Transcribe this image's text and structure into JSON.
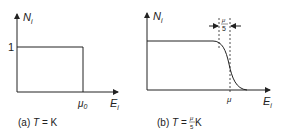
{
  "panel_a": {
    "y_label": "N",
    "y_label_sub": "i",
    "x_label": "E",
    "x_label_sub": "i",
    "y_tick": "1",
    "x_tick": "μ",
    "x_tick_sub": "0",
    "caption_prefix": "(a) ",
    "caption_T": "T",
    "caption_rest": " = K"
  },
  "panel_b": {
    "y_label": "N",
    "y_label_sub": "i",
    "x_label": "E",
    "x_label_sub": "i",
    "x_tick": "μ",
    "width_num": "μ",
    "width_den": "5",
    "caption_prefix": "(b) ",
    "caption_T": "T",
    "caption_eq": " = ",
    "caption_num": "μ",
    "caption_den": "5",
    "caption_unit": " K"
  },
  "colors": {
    "line": "#222222",
    "background": "#ffffff"
  }
}
